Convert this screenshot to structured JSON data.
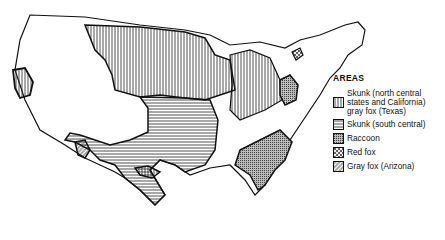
{
  "map": {
    "region": "United States",
    "legend": {
      "title": "AREAS",
      "items": [
        {
          "pattern": "vertical-lines",
          "label": "Skunk (north central\nstates and California)\ngray fox (Texas)"
        },
        {
          "pattern": "horizontal-lines",
          "label": "Skunk (south central)"
        },
        {
          "pattern": "stipple",
          "label": "Raccoon"
        },
        {
          "pattern": "dots",
          "label": "Red fox"
        },
        {
          "pattern": "diagonal-lines",
          "label": "Gray fox (Arizona)"
        }
      ]
    },
    "colors": {
      "ink": "#111111",
      "background": "#ffffff"
    }
  }
}
